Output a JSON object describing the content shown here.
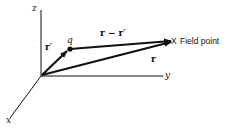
{
  "diagram": {
    "colors": {
      "background": "#ffffff",
      "stroke": "#111111"
    },
    "axes": {
      "z_label": "z",
      "y_label": "y",
      "x_label": "x"
    },
    "vectors": {
      "r_prime_label": "r′",
      "r_minus_r_prime_label": "r − r′",
      "r_label": "r"
    },
    "points": {
      "charge_label": "q",
      "field_point_marker": "X",
      "field_point_label": "Field point"
    }
  }
}
